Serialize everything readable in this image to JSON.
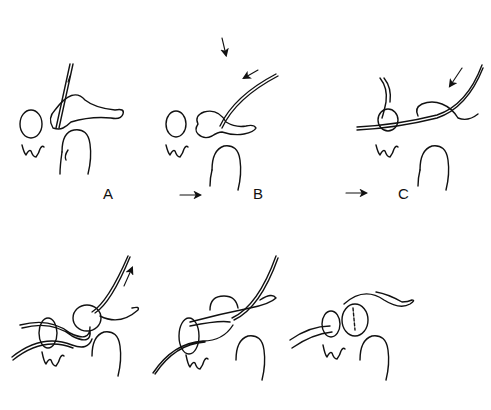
{
  "figure": {
    "panels": [
      {
        "id": "A",
        "label": "A",
        "row": 1
      },
      {
        "id": "B",
        "label": "B",
        "row": 1
      },
      {
        "id": "C",
        "label": "C",
        "row": 1
      },
      {
        "id": "D",
        "label": "",
        "row": 2
      },
      {
        "id": "E",
        "label": "",
        "row": 2
      },
      {
        "id": "F",
        "label": "",
        "row": 2
      }
    ],
    "sequence_arrows": [
      "arrow-right",
      "arrow-right"
    ],
    "line_color": "#111111",
    "background": "#ffffff"
  }
}
